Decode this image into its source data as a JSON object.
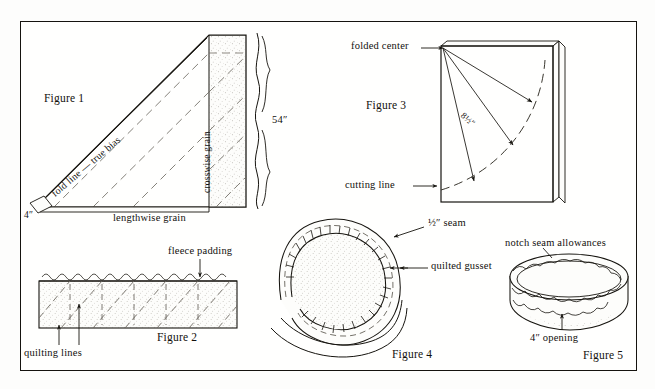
{
  "page": {
    "background_color": "#fdfdfc",
    "ink_color": "#12100d",
    "frame": {
      "x": 20,
      "y": 21,
      "width": 617,
      "height": 350
    }
  },
  "figures": [
    {
      "id": "figure-1",
      "caption": "Figure 1",
      "subject": "bias-fold fabric triangle layout",
      "labels": {
        "fold_line": "fold line — true bias",
        "lengthwise_grain": "lengthwise grain",
        "crosswise_grain": "crosswise grain",
        "width_measure": "54″",
        "strip_measure": "4″"
      }
    },
    {
      "id": "figure-2",
      "caption": "Figure 2",
      "subject": "quilted fabric cross-section with padding",
      "labels": {
        "padding": "fleece padding",
        "quilting": "quilting lines"
      }
    },
    {
      "id": "figure-3",
      "caption": "Figure 3",
      "subject": "folded square marked with radius arcs for circle cutting",
      "labels": {
        "folded_center": "folded center",
        "cutting_line": "cutting line",
        "radius": "8½″"
      }
    },
    {
      "id": "figure-4",
      "caption": "Figure 4",
      "subject": "round cushion top with clipped seam allowance and gusset",
      "labels": {
        "seam": "½″ seam",
        "gusset": "quilted gusset"
      }
    },
    {
      "id": "figure-5",
      "caption": "Figure 5",
      "subject": "assembled round box cushion with notched edges",
      "labels": {
        "notch": "notch seam allowances",
        "opening": "4″ opening"
      }
    }
  ]
}
